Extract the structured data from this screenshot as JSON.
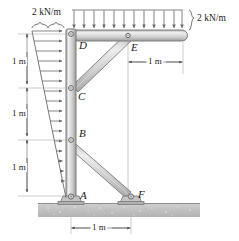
{
  "figure": {
    "type": "statics-free-body-diagram",
    "colors": {
      "member_fill": "#c9c9c9",
      "member_edge": "#6e6e6e",
      "member_highlight": "#e8e8e8",
      "line": "#555555",
      "ground": "#bdbdbd",
      "text": "#1a1a1a",
      "arrow": "#6a6a6a"
    }
  },
  "loads": {
    "horizontal": {
      "label": "2 kN/m",
      "distribution": "triangular",
      "max_at": "top",
      "min_at": "bottom",
      "direction": "rightward",
      "applied_to": "column A-D",
      "arrow_count": 17
    },
    "vertical": {
      "label": "2 kN/m",
      "distribution": "uniform",
      "direction": "downward",
      "applied_to": "beam D to free end",
      "arrow_count": 12
    }
  },
  "joints": [
    {
      "id": "D",
      "label": "D",
      "kind": "pin",
      "x": 72,
      "y": 34
    },
    {
      "id": "E",
      "label": "E",
      "kind": "pin",
      "x": 128,
      "y": 36
    },
    {
      "id": "C",
      "label": "C",
      "kind": "pin",
      "x": 72,
      "y": 88
    },
    {
      "id": "B",
      "label": "B",
      "kind": "pin",
      "x": 72,
      "y": 140
    },
    {
      "id": "A",
      "label": "A",
      "kind": "support-pin",
      "x": 72,
      "y": 196
    },
    {
      "id": "F",
      "label": "F",
      "kind": "support-pin",
      "x": 131,
      "y": 196
    }
  ],
  "dimensions": {
    "vertical": [
      {
        "label": "1 m",
        "from": "D",
        "to": "C"
      },
      {
        "label": "1 m",
        "from": "C",
        "to": "B"
      },
      {
        "label": "1 m",
        "from": "B",
        "to": "A"
      }
    ],
    "horizontal": [
      {
        "label": "1 m",
        "location": "beam, from E-station to free end"
      },
      {
        "label": "1 m",
        "location": "base, from A to F"
      }
    ]
  },
  "members": [
    {
      "name": "column",
      "from": "D",
      "to": "A"
    },
    {
      "name": "beam",
      "from": "D",
      "to": "free-end"
    },
    {
      "name": "brace-upper",
      "from": "E",
      "to": "C"
    },
    {
      "name": "brace-lower",
      "from": "B",
      "to": "F"
    }
  ],
  "ground": {
    "label": "",
    "style": "hatched-speckled"
  }
}
